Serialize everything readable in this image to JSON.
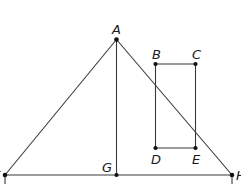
{
  "diagram": {
    "stroke_color": "#3a3a3a",
    "point_color": "#111111",
    "points": {
      "A": {
        "label": "A",
        "x": 116.5,
        "y": 39.5
      },
      "B": {
        "label": "B",
        "x": 155.5,
        "y": 64
      },
      "C": {
        "label": "C",
        "x": 195.5,
        "y": 64
      },
      "D": {
        "label": "D",
        "x": 155.5,
        "y": 148
      },
      "E": {
        "label": "E",
        "x": 195.5,
        "y": 148
      },
      "F": {
        "label": "F",
        "x": 5,
        "y": 175
      },
      "G": {
        "label": "G",
        "x": 116.5,
        "y": 175
      },
      "H": {
        "label": "H",
        "x": 232,
        "y": 175
      }
    },
    "segments": [
      [
        "A",
        "F"
      ],
      [
        "A",
        "H"
      ],
      [
        "A",
        "G"
      ],
      [
        "F",
        "H"
      ],
      [
        "B",
        "C"
      ],
      [
        "C",
        "E"
      ],
      [
        "E",
        "D"
      ],
      [
        "D",
        "B"
      ]
    ],
    "shapes": {
      "triangle": "AFH",
      "altitude": "AG",
      "rectangle": "BCED"
    }
  }
}
